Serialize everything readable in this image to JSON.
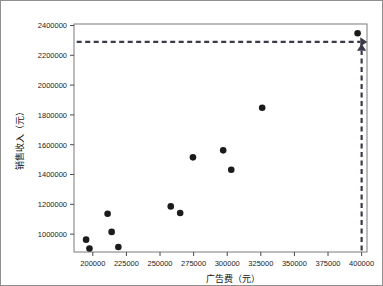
{
  "chart_data": {
    "type": "scatter",
    "title": "",
    "xlabel": "广告费（元）",
    "ylabel": "销售收入（元）",
    "xlim": [
      186000,
      404000
    ],
    "ylim": [
      880000,
      2410000
    ],
    "grid": false,
    "legend": "none",
    "xticks": [
      200000,
      225000,
      250000,
      275000,
      300000,
      325000,
      350000,
      375000,
      400000
    ],
    "xtick_labels": [
      "200000",
      "225000",
      "250000",
      "275000",
      "300000",
      "325000",
      "350000",
      "375000",
      "400000"
    ],
    "yticks": [
      1000000,
      1200000,
      1400000,
      1600000,
      1800000,
      2000000,
      2200000,
      2400000
    ],
    "ytick_labels": [
      "1000000",
      "1200000",
      "1400000",
      "1600000",
      "1800000",
      "2000000",
      "2200000",
      "2400000"
    ],
    "marker": "filled-circle",
    "marker_color": "#1b1b1b",
    "x": [
      195000,
      197500,
      211000,
      214000,
      219000,
      258000,
      265000,
      274500,
      297000,
      303000,
      326000,
      397000
    ],
    "y": [
      963000,
      903000,
      1137000,
      1015000,
      914000,
      1186000,
      1142000,
      1515000,
      1562000,
      1432000,
      1848000,
      2348000
    ],
    "points": [
      {
        "x": 195000,
        "y": 963000
      },
      {
        "x": 197500,
        "y": 903000
      },
      {
        "x": 211000,
        "y": 1137000
      },
      {
        "x": 214000,
        "y": 1015000
      },
      {
        "x": 219000,
        "y": 914000
      },
      {
        "x": 258000,
        "y": 1186000
      },
      {
        "x": 265000,
        "y": 1142000
      },
      {
        "x": 274500,
        "y": 1515000
      },
      {
        "x": 297000,
        "y": 1562000
      },
      {
        "x": 303000,
        "y": 1432000
      },
      {
        "x": 326000,
        "y": 1848000
      },
      {
        "x": 397000,
        "y": 2348000
      }
    ],
    "annotations": [
      {
        "name": "horizontal-prediction-arrow",
        "style": "dashed-arrow",
        "color": "#3a3a4a",
        "from": {
          "x": 188000,
          "y": 2290000
        },
        "to": {
          "x": 399000,
          "y": 2290000
        },
        "direction": "right"
      },
      {
        "name": "vertical-prediction-arrow",
        "style": "dashed-arrow",
        "color": "#3a3a4a",
        "from": {
          "x": 400000,
          "y": 890000
        },
        "to": {
          "x": 400000,
          "y": 2230000
        },
        "direction": "up"
      }
    ]
  }
}
